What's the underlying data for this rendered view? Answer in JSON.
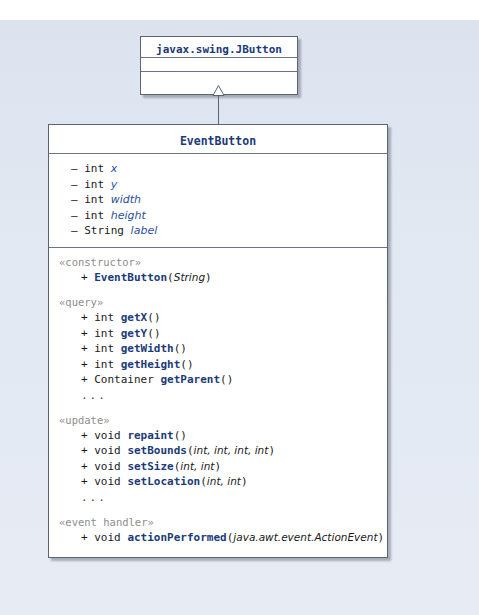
{
  "diagram": {
    "type": "uml-class-diagram",
    "background_color": "#e2e8f2",
    "box_fill": "#ffffff",
    "border_color": "#5b6470",
    "title_color": "#1b3a78",
    "stereotype_color": "#8d8d8d",
    "italic_name_color": "#2b4f9e",
    "relationship": "generalization"
  },
  "superclass": {
    "name": "javax.swing.JButton",
    "attributes_compartment": "",
    "operations_compartment": ""
  },
  "subclass": {
    "name": "EventButton",
    "attributes": [
      {
        "visibility": "–",
        "type": "int",
        "name": "x"
      },
      {
        "visibility": "–",
        "type": "int",
        "name": "y"
      },
      {
        "visibility": "–",
        "type": "int",
        "name": "width"
      },
      {
        "visibility": "–",
        "type": "int",
        "name": "height"
      },
      {
        "visibility": "–",
        "type": "String",
        "name": "label"
      }
    ],
    "operation_groups": [
      {
        "stereotype": "«constructor»",
        "operations": [
          {
            "visibility": "+",
            "type": "",
            "name": "EventButton",
            "params": "String"
          }
        ],
        "ellipsis": false
      },
      {
        "stereotype": "«query»",
        "operations": [
          {
            "visibility": "+",
            "type": "int",
            "name": "getX",
            "params": ""
          },
          {
            "visibility": "+",
            "type": "int",
            "name": "getY",
            "params": ""
          },
          {
            "visibility": "+",
            "type": "int",
            "name": "getWidth",
            "params": ""
          },
          {
            "visibility": "+",
            "type": "int",
            "name": "getHeight",
            "params": ""
          },
          {
            "visibility": "+",
            "type": "Container",
            "name": "getParent",
            "params": ""
          }
        ],
        "ellipsis": true
      },
      {
        "stereotype": "«update»",
        "operations": [
          {
            "visibility": "+",
            "type": "void",
            "name": "repaint",
            "params": ""
          },
          {
            "visibility": "+",
            "type": "void",
            "name": "setBounds",
            "params": "int, int, int, int"
          },
          {
            "visibility": "+",
            "type": "void",
            "name": "setSize",
            "params": "int, int"
          },
          {
            "visibility": "+",
            "type": "void",
            "name": "setLocation",
            "params": "int, int"
          }
        ],
        "ellipsis": true
      },
      {
        "stereotype": "«event handler»",
        "operations": [
          {
            "visibility": "+",
            "type": "void",
            "name": "actionPerformed",
            "params": "java.awt.event.ActionEvent"
          }
        ],
        "ellipsis": false
      }
    ]
  },
  "symbols": {
    "ellipsis": "...",
    "generalization_arrow": "hollow-triangle"
  }
}
